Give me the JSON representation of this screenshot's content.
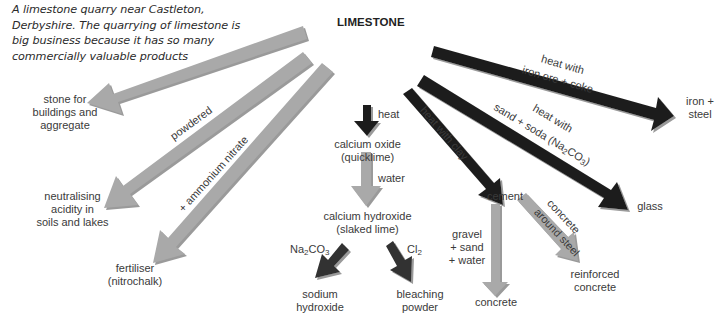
{
  "caption": "A limestone quarry near Castleton, Derbyshire. The quarrying of limestone is big business because it has so many commercially valuable products",
  "caption_lines": [
    "A limestone quarry near Castleton,",
    "Derbyshire. The quarrying of limestone is",
    "big business because it has so many",
    "commercially valuable products"
  ],
  "center_node": "LIMESTONE",
  "colors": {
    "dark_arrow": "#1e1e1e",
    "light_arrow": "#a9a9a9",
    "mid_arrow": "#3a3a3a",
    "shadow": "#888888"
  },
  "products": {
    "stone": [
      "stone for",
      "buildings and",
      "aggregate"
    ],
    "neutralising": [
      "neutralising",
      "acidity in",
      "soils and lakes"
    ],
    "fertiliser": [
      "fertiliser",
      "(nitrochalk)"
    ],
    "calcium_oxide": [
      "calcium oxide",
      "(quicklime)"
    ],
    "calcium_hydroxide": [
      "calcium hydroxide",
      "(slaked lime)"
    ],
    "sodium_hydroxide": [
      "sodium",
      "hydroxide"
    ],
    "bleaching_powder": [
      "bleaching",
      "powder"
    ],
    "cement": "cement",
    "concrete": "concrete",
    "reinforced_concrete": [
      "reinforced",
      "concrete"
    ],
    "glass": "glass",
    "iron_steel": [
      "iron +",
      "steel"
    ]
  },
  "conditions": {
    "powdered": "powdered",
    "ammonium_nitrate": "+ ammonium nitrate",
    "heat": "heat",
    "water": "water",
    "na2co3_prefix": "Na",
    "na2co3_sub1": "2",
    "na2co3_mid": "CO",
    "na2co3_sub2": "3",
    "cl2_prefix": "Cl",
    "cl2_sub": "2",
    "heat_with_clay": "heat with clay",
    "glass_line1": "heat with",
    "glass_line2_pre": "sand + soda (Na",
    "glass_line2_sub1": "2",
    "glass_line2_mid": "CO",
    "glass_line2_sub2": "3",
    "glass_line2_post": ")",
    "iron_line1": "heat with",
    "iron_line2": "iron ore + coke",
    "gravel": [
      "gravel",
      "+ sand",
      "+ water"
    ],
    "concrete_around_steel": [
      "concrete",
      "around steel"
    ]
  }
}
